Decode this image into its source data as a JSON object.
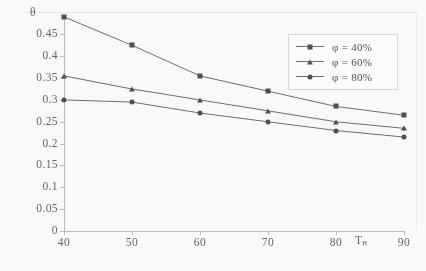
{
  "chart_data": {
    "type": "line",
    "title": "",
    "subtitle": "",
    "xlabel": "Tн",
    "ylabel": "θ",
    "x": [
      40,
      50,
      60,
      70,
      80,
      90
    ],
    "xticklabels": [
      "40",
      "50",
      "60",
      "70",
      "80",
      "90"
    ],
    "yticklabels": [
      "0.45",
      "0.4",
      "0.35",
      "0.3",
      "0.25",
      "0.2",
      "0.15",
      "0.1",
      "0.05",
      "0"
    ],
    "ytickvalues": [
      0.45,
      0.4,
      0.35,
      0.3,
      0.25,
      0.2,
      0.15,
      0.1,
      0.05,
      0
    ],
    "xlim": [
      40,
      90
    ],
    "ylim": [
      0,
      0.4875
    ],
    "grid": false,
    "legend_position": "top-right",
    "series": [
      {
        "name": "φ = 40%",
        "marker": "square",
        "values": [
          0.49,
          0.425,
          0.355,
          0.32,
          0.285,
          0.265
        ]
      },
      {
        "name": "φ = 60%",
        "marker": "triangle",
        "values": [
          0.355,
          0.325,
          0.3,
          0.275,
          0.25,
          0.235
        ]
      },
      {
        "name": "φ = 80%",
        "marker": "circle",
        "values": [
          0.3,
          0.295,
          0.27,
          0.25,
          0.23,
          0.215
        ]
      }
    ]
  },
  "axes": {
    "y_title": "θ",
    "x_title_main": "T",
    "x_title_sub": "н"
  },
  "legend": {
    "items": [
      {
        "label": "φ = 40%",
        "marker": "square"
      },
      {
        "label": "φ = 60%",
        "marker": "triangle"
      },
      {
        "label": "φ = 80%",
        "marker": "circle"
      }
    ]
  },
  "colors": {
    "line": "#6a6a6a",
    "marker": "#4a4a4a",
    "axis": "#b9b9b9",
    "text": "#5f5f5f",
    "legend_border": "#d8d8d8",
    "background": "#ffffff"
  }
}
